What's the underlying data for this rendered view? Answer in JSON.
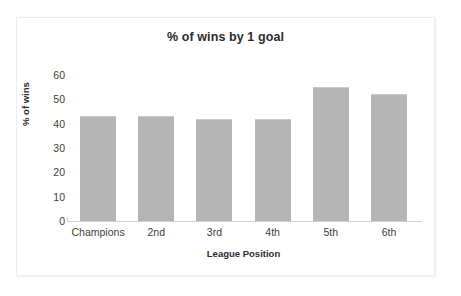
{
  "chart_data": {
    "type": "bar",
    "title": "% of wins by 1 goal",
    "xlabel": "League Position",
    "ylabel": "% of wins",
    "categories": [
      "Champions",
      "2nd",
      "3rd",
      "4th",
      "5th",
      "6th"
    ],
    "values": [
      43,
      43,
      42,
      42,
      55,
      52
    ],
    "ylim": [
      0,
      60
    ],
    "yticks": [
      0,
      10,
      20,
      30,
      40,
      50,
      60
    ],
    "ytick_labels": [
      "0",
      "10",
      "20",
      "30",
      "40",
      "50",
      "60"
    ],
    "grid": false,
    "legend": false,
    "bar_color": "#b5b5b5",
    "axis_color": "#d0d0d0",
    "text_color": "#2c2c2c",
    "background": "#ffffff"
  }
}
